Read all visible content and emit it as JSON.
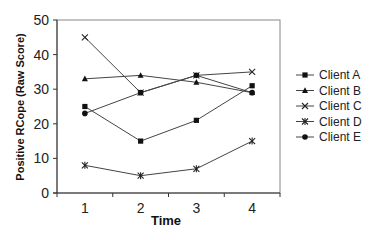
{
  "chart_data": {
    "type": "line",
    "title": "",
    "xlabel": "Time",
    "ylabel": "Positive RCope (Raw Score)",
    "categories": [
      "1",
      "2",
      "3",
      "4"
    ],
    "ylim": [
      0,
      50
    ],
    "yticks": [
      0,
      10,
      20,
      30,
      40,
      50
    ],
    "grid": false,
    "legend_position": "right",
    "series": [
      {
        "name": "Client A",
        "marker": "square",
        "values": [
          25,
          15,
          21,
          31
        ]
      },
      {
        "name": "Client B",
        "marker": "triangle",
        "values": [
          33,
          34,
          32,
          29
        ]
      },
      {
        "name": "Client C",
        "marker": "x",
        "values": [
          45,
          29,
          34,
          35
        ]
      },
      {
        "name": "Client D",
        "marker": "asterisk",
        "values": [
          8,
          5,
          7,
          15
        ]
      },
      {
        "name": "Client E",
        "marker": "circle",
        "values": [
          23,
          29,
          34,
          29
        ]
      }
    ],
    "line_color": "#444444"
  }
}
